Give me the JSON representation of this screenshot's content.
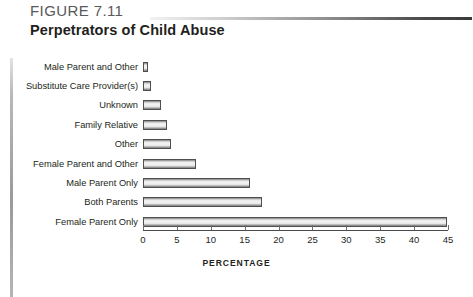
{
  "header": {
    "figure_label": "FIGURE 7.11",
    "title": "Perpetrators of Child Abuse"
  },
  "chart_data": {
    "type": "bar",
    "orientation": "horizontal",
    "title": "Perpetrators of Child Abuse",
    "xlabel": "PERCENTAGE",
    "ylabel": "",
    "xlim": [
      0,
      45
    ],
    "xticks": [
      0,
      5,
      10,
      15,
      20,
      25,
      30,
      35,
      40,
      45
    ],
    "grid": false,
    "legend": null,
    "categories": [
      "Male Parent and Other",
      "Substitute Care Provider(s)",
      "Unknown",
      "Family Relative",
      "Other",
      "Female Parent and Other",
      "Male Parent Only",
      "Both Parents",
      "Female Parent Only"
    ],
    "values": [
      0.8,
      1.2,
      2.7,
      3.6,
      4.2,
      7.8,
      15.8,
      17.6,
      44.8
    ]
  },
  "axis": {
    "title": "PERCENTAGE",
    "ticks": [
      "0",
      "5",
      "10",
      "15",
      "20",
      "25",
      "30",
      "35",
      "40",
      "45"
    ]
  },
  "footer": {
    "source_note": ""
  }
}
